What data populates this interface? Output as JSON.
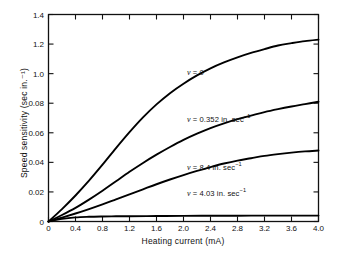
{
  "chart_data": {
    "type": "line",
    "title": "",
    "xlabel": "Heating current (mA)",
    "ylabel": "Speed sensitivity (sec in.⁻¹)",
    "xlim": [
      0,
      4.0
    ],
    "x_ticks": [
      "0",
      "0.4",
      "0.8",
      "1.2",
      "1.6",
      "2.0",
      "2.4",
      "2.8",
      "3.2",
      "3.6",
      "4.0"
    ],
    "y_ticks": [
      "0",
      "0.02",
      "0.04",
      "0.06",
      "0.08",
      "1.0",
      "1.2",
      "1.4"
    ],
    "y_tick_note": "Axis ticks are evenly spaced; upper three labels printed as 1.0/1.2/1.4 in the source figure",
    "grid": false,
    "legend_position": "inline-annotations",
    "series": [
      {
        "name": "v = 0",
        "label_text": "v = 0",
        "label_x": 2.05,
        "label_y_tick": 5.05,
        "end_value_tick": 6.15,
        "points": [
          [
            0.0,
            0.0
          ],
          [
            0.2,
            0.42
          ],
          [
            0.4,
            0.88
          ],
          [
            0.6,
            1.38
          ],
          [
            0.8,
            1.92
          ],
          [
            1.0,
            2.48
          ],
          [
            1.2,
            3.02
          ],
          [
            1.4,
            3.52
          ],
          [
            1.6,
            3.96
          ],
          [
            1.8,
            4.34
          ],
          [
            2.0,
            4.66
          ],
          [
            2.2,
            4.94
          ],
          [
            2.4,
            5.18
          ],
          [
            2.6,
            5.38
          ],
          [
            2.8,
            5.55
          ],
          [
            3.0,
            5.7
          ],
          [
            3.2,
            5.83
          ],
          [
            3.4,
            5.95
          ],
          [
            3.6,
            6.03
          ],
          [
            3.8,
            6.1
          ],
          [
            4.0,
            6.15
          ]
        ]
      },
      {
        "name": "v = 0.352 in. sec-1",
        "label_text": "v = 0.352 in. sec⁻¹",
        "label_x": 2.05,
        "label_y_tick": 3.45,
        "end_value_tick": 4.05,
        "points": [
          [
            0.0,
            0.0
          ],
          [
            0.2,
            0.22
          ],
          [
            0.4,
            0.46
          ],
          [
            0.6,
            0.74
          ],
          [
            0.8,
            1.04
          ],
          [
            1.0,
            1.36
          ],
          [
            1.2,
            1.68
          ],
          [
            1.4,
            1.98
          ],
          [
            1.6,
            2.26
          ],
          [
            1.8,
            2.52
          ],
          [
            2.0,
            2.76
          ],
          [
            2.2,
            2.97
          ],
          [
            2.4,
            3.16
          ],
          [
            2.6,
            3.32
          ],
          [
            2.8,
            3.46
          ],
          [
            3.0,
            3.58
          ],
          [
            3.2,
            3.7
          ],
          [
            3.4,
            3.8
          ],
          [
            3.6,
            3.89
          ],
          [
            3.8,
            3.97
          ],
          [
            4.0,
            4.05
          ]
        ]
      },
      {
        "name": "v = 8.4 in. sec-1",
        "label_text": "v = 8.4 in. sec⁻¹",
        "label_x": 2.05,
        "label_y_tick": 1.85,
        "end_value_tick": 2.4,
        "points": [
          [
            0.0,
            0.0
          ],
          [
            0.2,
            0.13
          ],
          [
            0.4,
            0.27
          ],
          [
            0.6,
            0.42
          ],
          [
            0.8,
            0.58
          ],
          [
            1.0,
            0.75
          ],
          [
            1.2,
            0.92
          ],
          [
            1.4,
            1.09
          ],
          [
            1.6,
            1.26
          ],
          [
            1.8,
            1.42
          ],
          [
            2.0,
            1.57
          ],
          [
            2.2,
            1.71
          ],
          [
            2.4,
            1.84
          ],
          [
            2.6,
            1.96
          ],
          [
            2.8,
            2.06
          ],
          [
            3.0,
            2.14
          ],
          [
            3.2,
            2.22
          ],
          [
            3.4,
            2.28
          ],
          [
            3.6,
            2.33
          ],
          [
            3.8,
            2.37
          ],
          [
            4.0,
            2.4
          ]
        ]
      },
      {
        "name": "v = 4.03 in. sec-1",
        "label_text": "v = 4.03 in. sec⁻¹",
        "label_x": 2.05,
        "label_y_tick": 0.95,
        "end_value_tick": 0.2,
        "points": [
          [
            0.0,
            0.0
          ],
          [
            0.2,
            0.09
          ],
          [
            0.4,
            0.14
          ],
          [
            0.6,
            0.16
          ],
          [
            0.8,
            0.17
          ],
          [
            1.0,
            0.175
          ],
          [
            1.2,
            0.18
          ],
          [
            1.6,
            0.185
          ],
          [
            2.0,
            0.19
          ],
          [
            2.4,
            0.193
          ],
          [
            2.8,
            0.196
          ],
          [
            3.2,
            0.198
          ],
          [
            3.6,
            0.199
          ],
          [
            4.0,
            0.2
          ]
        ]
      }
    ]
  },
  "style": {
    "axis_color": "#111111",
    "curve_color": "#000000",
    "background": "#ffffff"
  }
}
